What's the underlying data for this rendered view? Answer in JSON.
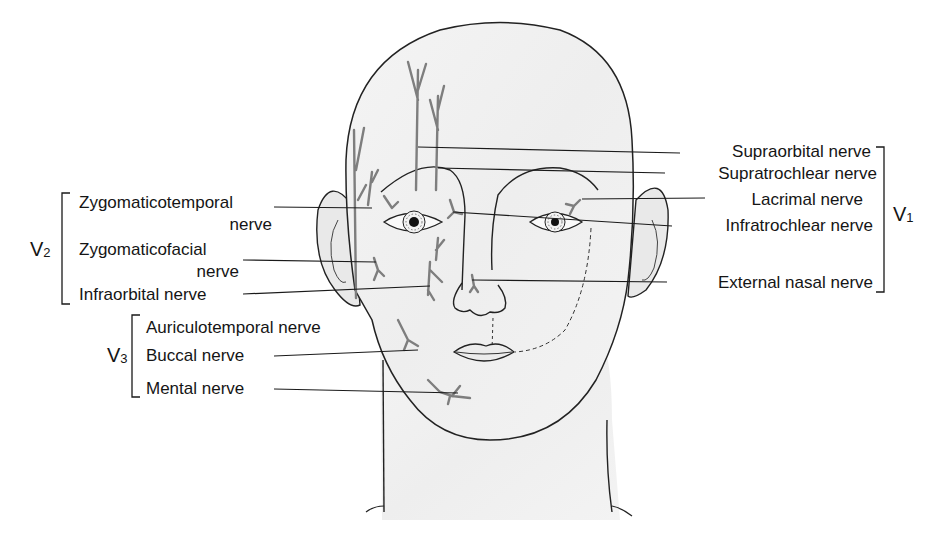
{
  "figure": {
    "colors": {
      "skin": "#f1f1f1",
      "outline": "#222222",
      "nerve": "#8a8a8a",
      "background": "#ffffff"
    }
  },
  "groups": {
    "v1": {
      "letter": "V",
      "sub": "1"
    },
    "v2": {
      "letter": "V",
      "sub": "2"
    },
    "v3": {
      "letter": "V",
      "sub": "3"
    }
  },
  "labels": {
    "v1": [
      {
        "text": "Supraorbital nerve"
      },
      {
        "text": "Supratrochlear nerve"
      },
      {
        "text": "Lacrimal nerve"
      },
      {
        "text": "Infratrochlear nerve"
      },
      {
        "text": "External nasal nerve"
      }
    ],
    "v2": [
      {
        "line1": "Zygomaticotemporal",
        "line2": "nerve"
      },
      {
        "line1": "Zygomaticofacial",
        "line2": "nerve"
      },
      {
        "line1": "Infraorbital nerve"
      }
    ],
    "v3": [
      {
        "text": "Auriculotemporal nerve"
      },
      {
        "text": "Buccal nerve"
      },
      {
        "text": "Mental nerve"
      }
    ]
  }
}
